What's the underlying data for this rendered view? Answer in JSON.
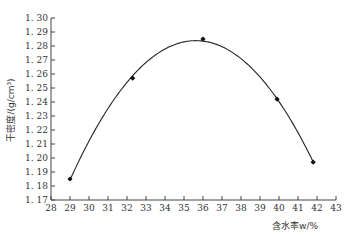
{
  "chart_data": {
    "type": "line",
    "title": "",
    "xlabel": "含水率w/%",
    "ylabel": "干密度/(g/cm³)",
    "xlim": [
      28,
      43
    ],
    "ylim": [
      1.17,
      1.3
    ],
    "x_ticks": [
      28,
      29,
      30,
      31,
      32,
      33,
      34,
      35,
      36,
      37,
      38,
      39,
      40,
      41,
      42,
      43
    ],
    "y_ticks": [
      "1.17",
      "1.18",
      "1.19",
      "1.20",
      "1.21",
      "1.22",
      "1.23",
      "1.24",
      "1.25",
      "1.26",
      "1.27",
      "1.28",
      "1.29",
      "1.30"
    ],
    "grid": false,
    "legend": null,
    "series": [
      {
        "name": "measured points",
        "marker": "diamond",
        "points": [
          {
            "x": 29.0,
            "y": 1.185
          },
          {
            "x": 32.3,
            "y": 1.257
          },
          {
            "x": 36.0,
            "y": 1.285
          },
          {
            "x": 39.9,
            "y": 1.242
          },
          {
            "x": 41.8,
            "y": 1.197
          }
        ]
      },
      {
        "name": "fitted curve",
        "style": "smooth"
      }
    ],
    "colors": {
      "line": "#222222",
      "axis": "#444444",
      "marker": "#111111"
    }
  }
}
